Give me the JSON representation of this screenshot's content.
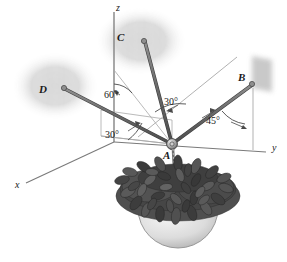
{
  "figure": {
    "background_color": "#ffffff",
    "width": 287,
    "height": 262
  },
  "axes": {
    "z": {
      "label": "z",
      "x": 119,
      "y": 4
    },
    "y": {
      "label": "y",
      "x": 272,
      "y": 147
    },
    "x": {
      "label": "x",
      "x": 16,
      "y": 185
    },
    "color": "#6b6b6b"
  },
  "points": {
    "A": {
      "label": "A",
      "x": 164,
      "y": 152,
      "node_x": 172,
      "node_y": 144
    },
    "B": {
      "label": "B",
      "x": 240,
      "y": 76,
      "node_x": 252,
      "node_y": 85
    },
    "C": {
      "label": "C",
      "x": 118,
      "y": 36,
      "node_x": 143,
      "node_y": 40
    },
    "D": {
      "label": "D",
      "x": 40,
      "y": 90,
      "node_x": 63,
      "node_y": 88
    }
  },
  "angles": [
    {
      "id": "angle-60",
      "label": "60°",
      "x": 108,
      "y": 93,
      "between": "z-axis and cable AC"
    },
    {
      "id": "angle-30-upper",
      "label": "30°",
      "x": 167,
      "y": 101,
      "between": "reference line and cable AC"
    },
    {
      "id": "angle-30-lower",
      "label": "30°",
      "x": 109,
      "y": 134,
      "between": "x-axis and cable AD"
    },
    {
      "id": "angle-45",
      "label": "45°",
      "x": 210,
      "y": 120,
      "between": "cable AB and vertical at B"
    }
  ],
  "cables": [
    {
      "id": "cable-AB",
      "from": "A",
      "to": "B",
      "color": "#6f6f6f"
    },
    {
      "id": "cable-AC",
      "from": "A",
      "to": "C",
      "color": "#6f6f6f"
    },
    {
      "id": "cable-AD",
      "from": "A",
      "to": "D",
      "color": "#6f6f6f"
    }
  ],
  "walls": [
    {
      "id": "wall-C",
      "kind": "brick",
      "x": 100,
      "y": 10,
      "width": 80,
      "height": 62
    },
    {
      "id": "wall-D",
      "kind": "brick",
      "x": 16,
      "y": 55,
      "width": 78,
      "height": 62
    },
    {
      "id": "wall-B",
      "kind": "plain",
      "x": 252,
      "y": 55,
      "width": 22,
      "height": 38
    }
  ],
  "plant": {
    "id": "hanging-plant",
    "pot_color": "#d8d8d8",
    "foliage_color": "#4a4a4a",
    "chain_color": "#8a8a8a",
    "center_x": 178,
    "center_y": 218
  },
  "colors": {
    "line": "#6b6b6b",
    "cable": "#707070",
    "cable_dark": "#4d4d4d",
    "brick": "#b9b9b9",
    "text": "#1a1a1a",
    "thin_line": "#9a9a9a"
  }
}
